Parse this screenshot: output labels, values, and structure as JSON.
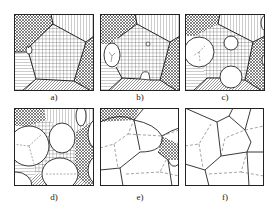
{
  "figure": {
    "panels": [
      {
        "id": "a",
        "label": "a)"
      },
      {
        "id": "b",
        "label": "b)"
      },
      {
        "id": "c",
        "label": "c)"
      },
      {
        "id": "d",
        "label": "d)"
      },
      {
        "id": "e",
        "label": "e)"
      },
      {
        "id": "f",
        "label": "f)"
      }
    ]
  },
  "colors": {
    "line": "#222222",
    "background": "#ffffff"
  }
}
